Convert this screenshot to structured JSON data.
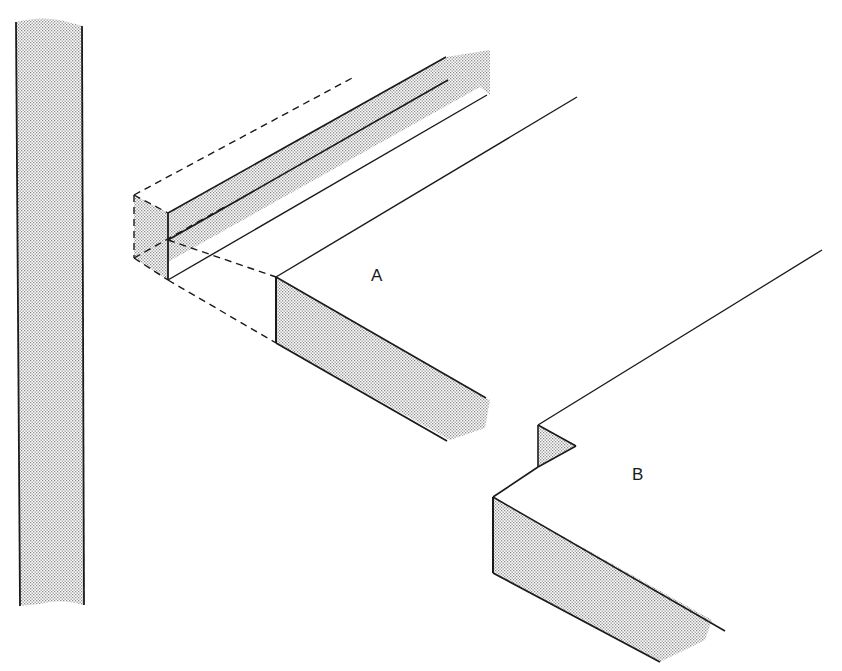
{
  "figure": {
    "type": "woodworking joint illustration",
    "labels": {
      "a": "A",
      "b": "B"
    },
    "colors": {
      "ink": "#1a1a1a",
      "stipple": "#9a9a9a",
      "background": "#ffffff"
    },
    "parts": [
      {
        "id": "strip",
        "description": "Separate stippled vertical strip (edge view of a board)"
      },
      {
        "id": "A",
        "description": "Board corner with a square strip (dashed outline) being fitted along the edge"
      },
      {
        "id": "B",
        "description": "Board corner with a notched/rebated edge"
      }
    ]
  }
}
